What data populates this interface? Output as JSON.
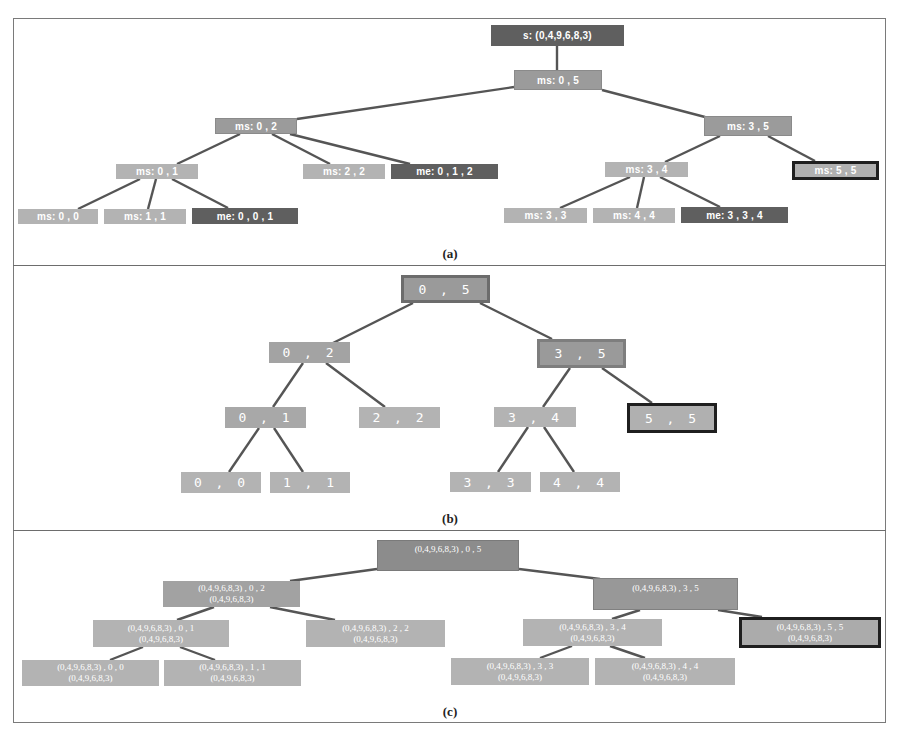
{
  "figure": {
    "panels": [
      {
        "label": "(a)",
        "nodes": {
          "s": "s: (0,4,9,6,8,3)",
          "ms_0_5": "ms: 0 , 5",
          "ms_0_2": "ms: 0 , 2",
          "ms_3_5": "ms: 3 , 5",
          "ms_0_1": "ms: 0 , 1",
          "ms_2_2": "ms: 2 , 2",
          "me_0_1_2": "me: 0 , 1 , 2",
          "ms_3_4": "ms: 3 , 4",
          "ms_5_5": "ms: 5 , 5",
          "ms_0_0": "ms: 0 , 0",
          "ms_1_1": "ms: 1 , 1",
          "me_0_0_1": "me: 0 , 0 , 1",
          "ms_3_3": "ms: 3 , 3",
          "ms_4_4": "ms: 4 , 4",
          "me_3_3_4": "me: 3 , 3 , 4"
        }
      },
      {
        "label": "(b)",
        "nodes": {
          "n_0_5": "0 , 5",
          "n_0_2": "0 , 2",
          "n_3_5": "3 , 5",
          "n_0_1": "0 , 1",
          "n_2_2": "2 , 2",
          "n_3_4": "3 , 4",
          "n_5_5": "5 , 5",
          "n_0_0": "0 , 0",
          "n_1_1": "1 , 1",
          "n_3_3": "3 , 3",
          "n_4_4": "4 , 4"
        }
      },
      {
        "label": "(c)",
        "nodes": {
          "root": {
            "line1": "(0,4,9,6,8,3) , 0 , 5",
            "line2": ""
          },
          "n_0_2": {
            "line1": "(0,4,9,6,8,3) , 0 , 2",
            "line2": "(0,4,9,6,8,3)"
          },
          "n_3_5": {
            "line1": "(0,4,9,6,8,3) , 3 , 5",
            "line2": ""
          },
          "n_0_1": {
            "line1": "(0,4,9,6,8,3) , 0 , 1",
            "line2": "(0,4,9,6,8,3)"
          },
          "n_2_2": {
            "line1": "(0,4,9,6,8,3) , 2 , 2",
            "line2": "(0,4,9,6,8,3)"
          },
          "n_3_4": {
            "line1": "(0,4,9,6,8,3) , 3 , 4",
            "line2": "(0,4,9,6,8,3)"
          },
          "n_5_5": {
            "line1": "(0,4,9,6,8,3) , 5 , 5",
            "line2": "(0,4,9,6,8,3)"
          },
          "n_0_0": {
            "line1": "(0,4,9,6,8,3) , 0 , 0",
            "line2": "(0,4,9,6,8,3)"
          },
          "n_1_1": {
            "line1": "(0,4,9,6,8,3) , 1 , 1",
            "line2": "(0,4,9,6,8,3)"
          },
          "n_3_3": {
            "line1": "(0,4,9,6,8,3) , 3 , 3",
            "line2": "(0,4,9,6,8,3)"
          },
          "n_4_4": {
            "line1": "(0,4,9,6,8,3) , 4 , 4",
            "line2": "(0,4,9,6,8,3)"
          }
        }
      }
    ],
    "colors": {
      "light_node": "#b3b3b3",
      "mid_node": "#9b9b9b",
      "dark_node": "#5f5f5f",
      "highlight_border": "#1f1f1f",
      "edge": "#555555"
    }
  }
}
